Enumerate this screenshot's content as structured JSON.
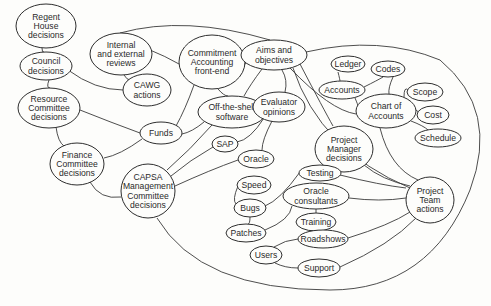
{
  "diagram": {
    "type": "influence-map",
    "colors": {
      "background": "#fdfdfb",
      "stroke": "#2e2e2e",
      "text": "#2a2a2a"
    },
    "nodes": [
      {
        "id": "regent",
        "lines": [
          "Regent",
          "House",
          "decisions"
        ],
        "cx": 46,
        "cy": 26,
        "rx": 30,
        "ry": 22
      },
      {
        "id": "council",
        "lines": [
          "Council",
          "decisions"
        ],
        "cx": 46,
        "cy": 66,
        "rx": 26,
        "ry": 14
      },
      {
        "id": "reviews",
        "lines": [
          "Internal",
          "and external",
          "reviews"
        ],
        "cx": 121,
        "cy": 54,
        "rx": 31,
        "ry": 21
      },
      {
        "id": "cawg",
        "lines": [
          "CAWG",
          "actions"
        ],
        "cx": 147,
        "cy": 90,
        "rx": 24,
        "ry": 16
      },
      {
        "id": "resource",
        "lines": [
          "Resource",
          "Committee",
          "decisions"
        ],
        "cx": 49,
        "cy": 108,
        "rx": 31,
        "ry": 20
      },
      {
        "id": "commitment",
        "lines": [
          "Commitment",
          "Accounting",
          "front-end"
        ],
        "cx": 212,
        "cy": 62,
        "rx": 33,
        "ry": 27
      },
      {
        "id": "aims",
        "lines": [
          "Aims and",
          "objectives"
        ],
        "cx": 274,
        "cy": 55,
        "rx": 33,
        "ry": 15
      },
      {
        "id": "ledger",
        "lines": [
          "Ledger"
        ],
        "cx": 348,
        "cy": 64,
        "rx": 17,
        "ry": 8
      },
      {
        "id": "codes",
        "lines": [
          "Codes"
        ],
        "cx": 388,
        "cy": 69,
        "rx": 17,
        "ry": 8
      },
      {
        "id": "accounts",
        "lines": [
          "Accounts"
        ],
        "cx": 342,
        "cy": 90,
        "rx": 23,
        "ry": 9
      },
      {
        "id": "scope",
        "lines": [
          "Scope"
        ],
        "cx": 425,
        "cy": 92,
        "rx": 18,
        "ry": 9
      },
      {
        "id": "chart",
        "lines": [
          "Chart of",
          "Accounts"
        ],
        "cx": 386,
        "cy": 111,
        "rx": 30,
        "ry": 17
      },
      {
        "id": "cost",
        "lines": [
          "Cost"
        ],
        "cx": 433,
        "cy": 115,
        "rx": 16,
        "ry": 9
      },
      {
        "id": "schedule",
        "lines": [
          "Schedule"
        ],
        "cx": 438,
        "cy": 138,
        "rx": 23,
        "ry": 9
      },
      {
        "id": "funds",
        "lines": [
          "Funds"
        ],
        "cx": 161,
        "cy": 133,
        "rx": 21,
        "ry": 11
      },
      {
        "id": "offshelf",
        "lines": [
          "Off-the-shelf",
          "software"
        ],
        "cx": 232,
        "cy": 112,
        "rx": 34,
        "ry": 16
      },
      {
        "id": "evaluator",
        "lines": [
          "Evaluator",
          "opinions"
        ],
        "cx": 279,
        "cy": 107,
        "rx": 26,
        "ry": 15
      },
      {
        "id": "pmdecisions",
        "lines": [
          "Project",
          "Manager",
          "decisions"
        ],
        "cx": 344,
        "cy": 149,
        "rx": 29,
        "ry": 23
      },
      {
        "id": "finance",
        "lines": [
          "Finance",
          "Committee",
          "decisions"
        ],
        "cx": 77,
        "cy": 164,
        "rx": 27,
        "ry": 21
      },
      {
        "id": "sap",
        "lines": [
          "SAP"
        ],
        "cx": 225,
        "cy": 144,
        "rx": 13,
        "ry": 8
      },
      {
        "id": "oracle",
        "lines": [
          "Oracle"
        ],
        "cx": 256,
        "cy": 159,
        "rx": 18,
        "ry": 9
      },
      {
        "id": "capsa",
        "lines": [
          "CAPSA",
          "Management",
          "Committee",
          "decisions"
        ],
        "cx": 148,
        "cy": 191,
        "rx": 27,
        "ry": 27
      },
      {
        "id": "speed",
        "lines": [
          "Speed"
        ],
        "cx": 254,
        "cy": 185,
        "rx": 17,
        "ry": 9
      },
      {
        "id": "testing",
        "lines": [
          "Testing"
        ],
        "cx": 320,
        "cy": 173,
        "rx": 21,
        "ry": 8
      },
      {
        "id": "oracleconsultants",
        "lines": [
          "Oracle",
          "consultants"
        ],
        "cx": 316,
        "cy": 196,
        "rx": 33,
        "ry": 13
      },
      {
        "id": "pteam",
        "lines": [
          "Project",
          "Team",
          "actions"
        ],
        "cx": 430,
        "cy": 200,
        "rx": 24,
        "ry": 23
      },
      {
        "id": "bugs",
        "lines": [
          "Bugs"
        ],
        "cx": 250,
        "cy": 208,
        "rx": 16,
        "ry": 9
      },
      {
        "id": "training",
        "lines": [
          "Training"
        ],
        "cx": 316,
        "cy": 222,
        "rx": 20,
        "ry": 9
      },
      {
        "id": "patches",
        "lines": [
          "Patches"
        ],
        "cx": 246,
        "cy": 233,
        "rx": 20,
        "ry": 9
      },
      {
        "id": "roadshows",
        "lines": [
          "Roadshows"
        ],
        "cx": 323,
        "cy": 239,
        "rx": 25,
        "ry": 9
      },
      {
        "id": "users",
        "lines": [
          "Users"
        ],
        "cx": 266,
        "cy": 255,
        "rx": 16,
        "ry": 9
      },
      {
        "id": "support",
        "lines": [
          "Support",
          ""
        ],
        "cx": 319,
        "cy": 268,
        "rx": 21,
        "ry": 9
      }
    ],
    "edges": [
      {
        "from": "regent",
        "to": "council",
        "d": "M42,48 Q42,53 44,52"
      },
      {
        "from": "council",
        "to": "resource",
        "d": "M49,80 Q46,88 50,88"
      },
      {
        "from": "council",
        "to": "cawg",
        "d": "M68,70 Q95,90 123,90"
      },
      {
        "from": "resource",
        "to": "funds",
        "d": "M80,110 Q110,122 140,133"
      },
      {
        "from": "resource",
        "to": "finance",
        "d": "M56,127 Q58,142 64,146"
      },
      {
        "from": "reviews",
        "to": "cawg",
        "d": "M124,75 Q127,80 130,80"
      },
      {
        "from": "reviews",
        "to": "commitment",
        "d": "M150,50 Q165,56 179,64"
      },
      {
        "from": "reviews",
        "to": "aims",
        "d": "M120,33 Q185,15 270,40"
      },
      {
        "from": "commitment",
        "to": "aims",
        "d": "M244,64 Q250,64 241,58"
      },
      {
        "from": "commitment",
        "to": "offshelf",
        "d": "M218,89 Q224,96 228,96"
      },
      {
        "from": "commitment",
        "to": "funds",
        "d": "M194,85 Q185,110 176,126"
      },
      {
        "from": "funds",
        "to": "finance",
        "d": "M142,139 Q120,155 104,158"
      },
      {
        "from": "funds",
        "to": "offshelf",
        "d": "M182,134 Q192,132 204,122"
      },
      {
        "from": "aims",
        "to": "offshelf",
        "d": "M262,69 Q250,85 244,96"
      },
      {
        "from": "aims",
        "to": "evaluator",
        "d": "M282,70 Q288,80 285,92"
      },
      {
        "from": "aims",
        "to": "chart",
        "d": "M290,68 Q330,110 356,114"
      },
      {
        "from": "aims",
        "to": "pmdecisions",
        "d": "M300,64 Q324,110 333,126"
      },
      {
        "from": "aims",
        "to": "pteam",
        "d": "M293,68 Q320,150 410,188"
      },
      {
        "from": "aims",
        "to": "outer",
        "d": "M306,52 Q380,35 440,60 Q500,110 470,190 Q430,290 330,290 Q200,290 157,218"
      },
      {
        "from": "ledger",
        "to": "accounts",
        "d": "M338,72 Q340,80 340,81"
      },
      {
        "from": "accounts",
        "to": "codes",
        "d": "M364,87 Q378,80 383,77"
      },
      {
        "from": "accounts",
        "to": "chart",
        "d": "M355,98 Q358,105 358,106"
      },
      {
        "from": "codes",
        "to": "chart",
        "d": "M393,77 Q388,88 389,94"
      },
      {
        "from": "chart",
        "to": "scope",
        "d": "M404,97 Q404,86 408,90"
      },
      {
        "from": "chart",
        "to": "cost",
        "d": "M416,110 Q420,112 418,114"
      },
      {
        "from": "chart",
        "to": "schedule",
        "d": "M411,121 Q424,126 428,130"
      },
      {
        "from": "chart",
        "to": "pteam",
        "d": "M380,128 Q390,168 418,180"
      },
      {
        "from": "pmdecisions",
        "to": "pteam",
        "d": "M364,165 Q382,180 410,186"
      },
      {
        "from": "evaluator",
        "to": "oracle",
        "d": "M272,121 Q262,140 262,150"
      },
      {
        "from": "evaluator",
        "to": "sap",
        "d": "M264,118 Q250,140 237,142"
      },
      {
        "from": "offshelf",
        "to": "capsa",
        "d": "M212,125 Q190,150 167,170"
      },
      {
        "from": "sap",
        "to": "capsa",
        "d": "M213,147 Q190,160 171,176"
      },
      {
        "from": "oracle",
        "to": "capsa",
        "d": "M238,160 Q210,170 175,186"
      },
      {
        "from": "finance",
        "to": "capsa",
        "d": "M90,182 Q100,200 121,197"
      },
      {
        "from": "testing",
        "to": "pteam",
        "d": "M340,175 Q380,185 406,188"
      },
      {
        "from": "oracleconsultants",
        "to": "pteam",
        "d": "M349,198 Q380,202 406,198"
      },
      {
        "from": "oracleconsultants",
        "to": "training",
        "d": "M316,209 L316,213"
      },
      {
        "from": "roadshows",
        "to": "pteam",
        "d": "M348,238 Q390,225 410,212"
      },
      {
        "from": "support",
        "to": "pteam",
        "d": "M340,267 Q390,245 416,218"
      },
      {
        "from": "testing",
        "to": "bugs",
        "d": "M300,172 Q280,200 265,206"
      },
      {
        "from": "speed",
        "to": "bugs",
        "d": "M238,186 Q232,200 236,204"
      },
      {
        "from": "bugs",
        "to": "patches",
        "d": "M250,217 Q250,224 248,224"
      },
      {
        "from": "patches",
        "to": "oracleconsultants",
        "d": "M265,230 Q290,220 292,206"
      },
      {
        "from": "users",
        "to": "roadshows",
        "d": "M274,247 Q285,240 298,239"
      },
      {
        "from": "users",
        "to": "support",
        "d": "M275,263 Q285,268 298,268"
      }
    ]
  }
}
